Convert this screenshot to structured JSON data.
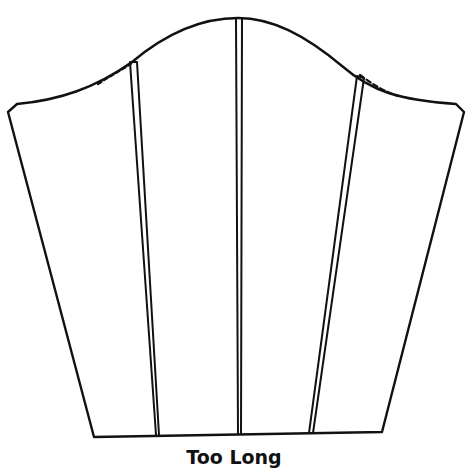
{
  "figure": {
    "type": "sleeve pattern piece diagram",
    "caption": "Too Long",
    "stroke_color": "#111111",
    "background": "#ffffff"
  },
  "elements": {
    "outline": "sleeve-outline",
    "slash_lines": [
      "left-slash-line",
      "center-slash-line",
      "right-slash-line"
    ]
  }
}
